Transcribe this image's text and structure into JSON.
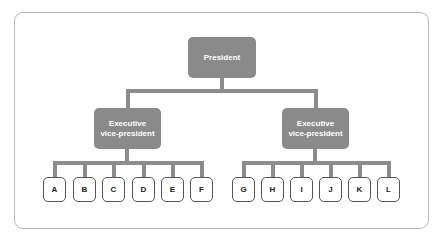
{
  "diagram": {
    "type": "org-chart",
    "root": {
      "label": "President",
      "children": [
        {
          "label": "Executive vice-president",
          "line1": "Executive",
          "line2": "vice-president",
          "children": [
            "A",
            "B",
            "C",
            "D",
            "E",
            "F"
          ]
        },
        {
          "label": "Executive vice-president",
          "line1": "Executive",
          "line2": "vice-president",
          "children": [
            "G",
            "H",
            "I",
            "J",
            "K",
            "L"
          ]
        }
      ]
    }
  },
  "colors": {
    "node_fill": "#8a8a8a",
    "connector": "#8c8c8c",
    "leaf_border": "#555555",
    "frame_border": "#b8b8b8"
  }
}
